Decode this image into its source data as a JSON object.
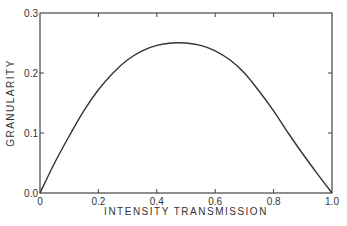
{
  "chart_data": {
    "type": "line",
    "title": "",
    "xlabel": "INTENSITY TRANSMISSION",
    "ylabel": "GRANULARITY",
    "xlim": [
      0,
      1.0
    ],
    "ylim": [
      0,
      0.3
    ],
    "grid": false,
    "legend": null,
    "x_ticks": [
      "0",
      "0.2",
      "0.4",
      "0.6",
      "0.8",
      "1.0"
    ],
    "y_ticks": [
      "0.0",
      "0.1",
      "0.2",
      "0.3"
    ],
    "series": [
      {
        "name": "granularity",
        "x": [
          0,
          0.05,
          0.1,
          0.15,
          0.2,
          0.25,
          0.3,
          0.35,
          0.4,
          0.45,
          0.5,
          0.55,
          0.6,
          0.65,
          0.7,
          0.75,
          0.8,
          0.85,
          0.9,
          0.95,
          1.0
        ],
        "y": [
          0,
          0.05,
          0.095,
          0.137,
          0.172,
          0.2,
          0.222,
          0.237,
          0.246,
          0.25,
          0.25,
          0.246,
          0.237,
          0.222,
          0.2,
          0.17,
          0.137,
          0.1,
          0.065,
          0.032,
          0
        ]
      }
    ]
  }
}
